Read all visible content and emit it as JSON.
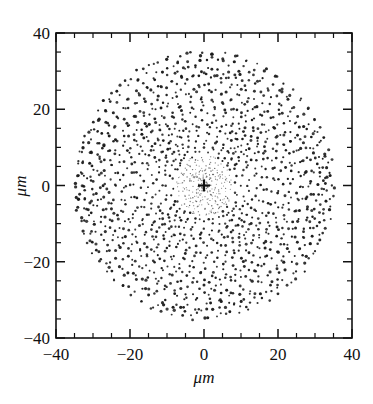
{
  "chart_data": {
    "type": "scatter",
    "title": "",
    "subtitle": "",
    "xlabel": "μm",
    "ylabel": "μm",
    "xlim": [
      -40,
      40
    ],
    "ylim": [
      -40,
      40
    ],
    "x_ticks": [
      -40,
      -20,
      0,
      20,
      40
    ],
    "y_ticks": [
      -40,
      -20,
      0,
      20,
      40
    ],
    "x_tick_labels": [
      "−40",
      "−20",
      "0",
      "20",
      "40"
    ],
    "y_tick_labels": [
      "−40",
      "−20",
      "0",
      "20",
      "40"
    ],
    "minor_tick_step": 5,
    "tick_direction": "in",
    "grid": false,
    "legend": null,
    "frame": "box",
    "annotations": [
      {
        "name": "origin-cross-marker",
        "symbol": "+",
        "x": 0,
        "y": 0
      }
    ],
    "series": [
      {
        "name": "ray-intercept-points",
        "marker": "dot",
        "color": "#1a1a1a",
        "description": "Dense approximately circular cloud of spot-diagram intercept points, radius about 35 micrometres, with concentric ring and rosette structure and fourfold symmetry; density increases toward the outer rim, inner core dots are fine and faint.",
        "point_count_approx": 1800,
        "cloud_radius_um": 35,
        "inner_faint_radius_um": 8
      }
    ]
  },
  "axes": {
    "x_title": "μm",
    "y_title": "μm",
    "x_labels": [
      "−40",
      "−20",
      "0",
      "20",
      "40"
    ],
    "y_labels": [
      "40",
      "20",
      "0",
      "−20",
      "−40"
    ],
    "colors": {
      "frame": "#111111",
      "data": "#1a1a1a",
      "background": "#ffffff"
    }
  },
  "caption": {
    "ghost_text": ""
  }
}
